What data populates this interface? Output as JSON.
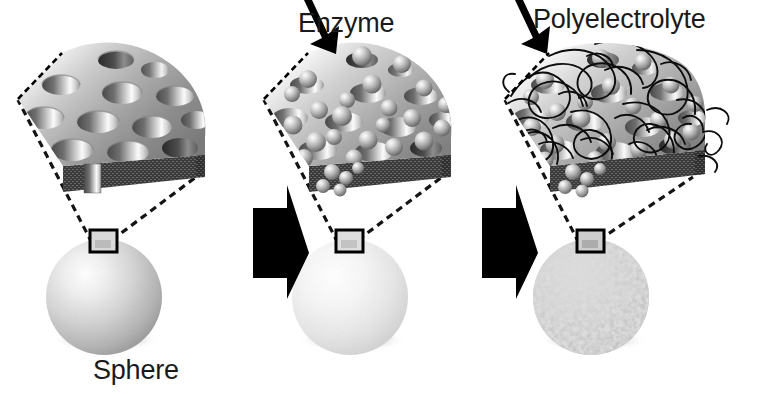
{
  "figure": {
    "width": 762,
    "height": 394,
    "background": "#ffffff"
  },
  "labels": {
    "enzyme": "Enzyme",
    "polyelectrolyte": "Polyelectrolyte",
    "sphere": "Sphere"
  },
  "colors": {
    "text": "#1a1a1a",
    "arrow_black": "#000000",
    "dashed_line": "#111111",
    "slab_top_light": "#f2f2f2",
    "slab_top_mid": "#b9b9b9",
    "slab_top_dark": "#6e6e6e",
    "slab_side_dark": "#3a3a3a",
    "pore_shadow": "#5a5a5a",
    "enzyme_bead_light": "#e8e8e8",
    "enzyme_bead_dark": "#707070",
    "sphere_highlight": "#ffffff",
    "sphere_mid": "#cfcfcf",
    "sphere_shadow": "#8a8a8a",
    "coated_sphere_speck": "#9a9a9a",
    "polymer_chain": "#0d0d0d"
  },
  "stages": [
    {
      "id": "stage-1",
      "name": "porous-sphere",
      "label": "Sphere",
      "has_label": true,
      "slab_type": "porous",
      "sphere_type": "smooth",
      "pore_count": 13,
      "enzyme_count": 0,
      "has_polymer": false
    },
    {
      "id": "stage-2",
      "name": "enzyme-loaded-sphere",
      "label": "Enzyme",
      "has_label": true,
      "slab_type": "porous-with-enzyme",
      "sphere_type": "smooth-light",
      "pore_count": 13,
      "enzyme_count": 26,
      "has_polymer": false
    },
    {
      "id": "stage-3",
      "name": "polyelectrolyte-coated-sphere",
      "label": "Polyelectrolyte",
      "has_label": true,
      "slab_type": "porous-with-enzyme-and-polymer",
      "sphere_type": "mottled",
      "pore_count": 13,
      "enzyme_count": 22,
      "has_polymer": true
    }
  ],
  "transitions": [
    {
      "id": "transition-1",
      "name": "arrow-stage1-to-stage2",
      "direction": "right"
    },
    {
      "id": "transition-2",
      "name": "arrow-stage2-to-stage3",
      "direction": "right"
    }
  ],
  "callouts": [
    {
      "id": "callout-1",
      "name": "magnification-box-1",
      "description": "zoom box on sphere surface"
    },
    {
      "id": "callout-2",
      "name": "magnification-box-2",
      "description": "zoom box on sphere surface"
    },
    {
      "id": "callout-3",
      "name": "magnification-box-3",
      "description": "zoom box on sphere surface"
    }
  ],
  "pointer_arrows": [
    {
      "id": "pointer-enzyme",
      "name": "enzyme-pointer-arrow",
      "points_to": "slab surface"
    },
    {
      "id": "pointer-polyelectrolyte",
      "name": "polyelectrolyte-pointer-arrow",
      "points_to": "polymer layer"
    }
  ]
}
